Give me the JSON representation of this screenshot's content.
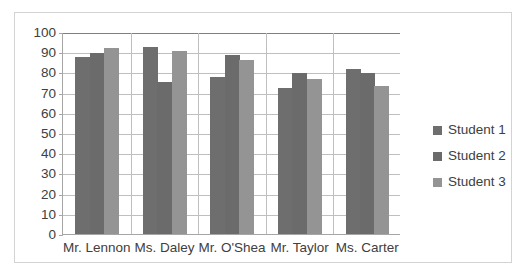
{
  "chart_data": {
    "type": "bar",
    "title": "",
    "subtitle": "",
    "xlabel": "",
    "ylabel": "",
    "categories": [
      "Mr. Lennon",
      "Ms. Daley",
      "Mr. O'Shea",
      "Mr. Taylor",
      "Ms. Carter"
    ],
    "series": [
      {
        "name": "Student 1",
        "color": "#6e6e6e",
        "values": [
          87.5,
          92.5,
          77.5,
          72.5,
          81.5
        ]
      },
      {
        "name": "Student 2",
        "color": "#6b6b6b",
        "values": [
          89.5,
          75.5,
          88.5,
          79.5,
          79.5
        ]
      },
      {
        "name": "Student 3",
        "color": "#949494",
        "values": [
          92,
          90.5,
          86,
          76.5,
          73.5
        ]
      }
    ],
    "ylim": [
      0,
      100
    ],
    "ytick_step": 10,
    "yticks": [
      0,
      10,
      20,
      30,
      40,
      50,
      60,
      70,
      80,
      90,
      100
    ],
    "ytick_labels": [
      "0",
      "10",
      "20",
      "30",
      "40",
      "50",
      "60",
      "70",
      "80",
      "90",
      "100"
    ],
    "grid": true,
    "grid_axis": "y",
    "legend": true,
    "legend_position": "right",
    "legend_entries": [
      "Student 1",
      "Student 2",
      "Student 3"
    ]
  }
}
